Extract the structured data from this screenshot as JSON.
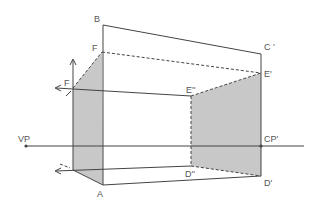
{
  "diagram": {
    "type": "perspective-construction",
    "colors": {
      "line": "#444444",
      "shade": "#c8c8c8",
      "label": "#555555",
      "background": "#ffffff"
    },
    "labels": {
      "B": "B",
      "F_top": "F",
      "F_left": "F",
      "C_prime": "C '",
      "E_prime": "E'",
      "E_double": "E''",
      "VP": "VP",
      "CP_prime": "CP'",
      "D_double": "D''",
      "D_prime": "D'",
      "A": "A"
    }
  }
}
